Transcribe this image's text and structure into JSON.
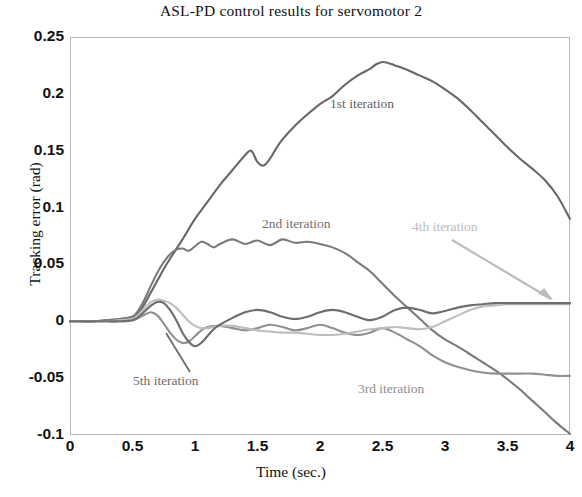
{
  "chart_data": {
    "type": "line",
    "title": "ASL-PD control results for servomotor 2",
    "xlabel": "Time (sec.)",
    "ylabel": "Tracking error (rad)",
    "xlim": [
      0,
      4
    ],
    "ylim": [
      -0.1,
      0.25
    ],
    "grid": false,
    "legend_position": "inline-annotations",
    "xticks": [
      "0",
      "0.5",
      "1",
      "1.5",
      "2",
      "2.5",
      "3",
      "3.5",
      "4"
    ],
    "xtick_values": [
      0,
      0.5,
      1,
      1.5,
      2,
      2.5,
      3,
      3.5,
      4
    ],
    "yticks": [
      "0.25",
      "0.2",
      "0.15",
      "0.1",
      "0.05",
      "0",
      "-0.05",
      "-0.1"
    ],
    "ytick_values": [
      0.25,
      0.2,
      0.15,
      0.1,
      0.05,
      0,
      -0.05,
      -0.1
    ],
    "annotations": [
      {
        "label": "1st iteration",
        "series": "1st iteration",
        "color": "#5f5f5f"
      },
      {
        "label": "2nd iteration",
        "series": "2nd iteration",
        "color": "#707070"
      },
      {
        "label": "3rd iteration",
        "series": "3rd iteration",
        "color": "#8d8d8d"
      },
      {
        "label": "4th iteration",
        "series": "4th iteration",
        "color": "#bcbcbc",
        "leader": "arrow"
      },
      {
        "label": "5th iteration",
        "series": "5th iteration",
        "color": "#6d6d6d",
        "leader": "line"
      }
    ],
    "series": [
      {
        "name": "1st iteration",
        "color": "#676767",
        "x": [
          0,
          0.1,
          0.2,
          0.3,
          0.4,
          0.5,
          0.55,
          0.6,
          0.65,
          0.7,
          0.75,
          0.8,
          0.9,
          1.0,
          1.1,
          1.2,
          1.3,
          1.4,
          1.45,
          1.5,
          1.55,
          1.6,
          1.65,
          1.7,
          1.8,
          1.9,
          2.0,
          2.1,
          2.2,
          2.3,
          2.4,
          2.45,
          2.5,
          2.55,
          2.6,
          2.7,
          2.8,
          2.9,
          3.0,
          3.1,
          3.2,
          3.3,
          3.4,
          3.5,
          3.6,
          3.7,
          3.8,
          3.9,
          4.0
        ],
        "y": [
          0.0,
          0.0,
          0.0,
          0.001,
          0.002,
          0.004,
          0.008,
          0.016,
          0.026,
          0.036,
          0.046,
          0.055,
          0.072,
          0.09,
          0.105,
          0.12,
          0.133,
          0.146,
          0.15,
          0.14,
          0.137,
          0.143,
          0.152,
          0.16,
          0.172,
          0.182,
          0.191,
          0.198,
          0.208,
          0.216,
          0.222,
          0.226,
          0.228,
          0.227,
          0.225,
          0.221,
          0.216,
          0.211,
          0.204,
          0.196,
          0.186,
          0.175,
          0.164,
          0.153,
          0.143,
          0.134,
          0.124,
          0.11,
          0.09
        ]
      },
      {
        "name": "2nd iteration",
        "color": "#7a7a7a",
        "x": [
          0,
          0.1,
          0.2,
          0.3,
          0.4,
          0.5,
          0.55,
          0.6,
          0.65,
          0.7,
          0.75,
          0.8,
          0.85,
          0.9,
          0.95,
          1.0,
          1.05,
          1.1,
          1.15,
          1.2,
          1.3,
          1.4,
          1.5,
          1.6,
          1.7,
          1.8,
          1.9,
          2.0,
          2.1,
          2.2,
          2.3,
          2.4,
          2.5,
          2.6,
          2.7,
          2.8,
          2.9,
          3.0,
          3.1,
          3.2,
          3.3,
          3.4,
          3.5,
          3.6,
          3.7,
          3.8,
          3.9,
          4.0
        ],
        "y": [
          0.0,
          0.0,
          0.0,
          0.001,
          0.002,
          0.004,
          0.01,
          0.02,
          0.032,
          0.043,
          0.052,
          0.059,
          0.063,
          0.064,
          0.062,
          0.066,
          0.07,
          0.068,
          0.065,
          0.068,
          0.072,
          0.068,
          0.071,
          0.067,
          0.072,
          0.069,
          0.07,
          0.068,
          0.065,
          0.06,
          0.052,
          0.044,
          0.033,
          0.022,
          0.012,
          0.002,
          -0.008,
          -0.016,
          -0.022,
          -0.029,
          -0.036,
          -0.043,
          -0.051,
          -0.06,
          -0.07,
          -0.08,
          -0.09,
          -0.099
        ]
      },
      {
        "name": "3rd iteration",
        "color": "#909090",
        "x": [
          0,
          0.1,
          0.2,
          0.3,
          0.4,
          0.5,
          0.55,
          0.6,
          0.65,
          0.7,
          0.75,
          0.8,
          0.85,
          0.9,
          0.95,
          1.0,
          1.05,
          1.1,
          1.2,
          1.3,
          1.4,
          1.5,
          1.6,
          1.7,
          1.8,
          1.9,
          2.0,
          2.1,
          2.2,
          2.3,
          2.4,
          2.5,
          2.6,
          2.7,
          2.8,
          2.9,
          3.0,
          3.1,
          3.2,
          3.3,
          3.4,
          3.5,
          3.6,
          3.7,
          3.8,
          3.9,
          4.0
        ],
        "y": [
          0.0,
          0.0,
          0.0,
          0.0,
          0.0,
          0.001,
          0.003,
          0.006,
          0.008,
          0.005,
          -0.002,
          -0.01,
          -0.016,
          -0.019,
          -0.018,
          -0.013,
          -0.008,
          -0.005,
          -0.004,
          -0.006,
          -0.008,
          -0.006,
          -0.003,
          -0.005,
          -0.008,
          -0.006,
          -0.003,
          -0.006,
          -0.01,
          -0.012,
          -0.01,
          -0.006,
          -0.01,
          -0.016,
          -0.022,
          -0.03,
          -0.036,
          -0.04,
          -0.043,
          -0.045,
          -0.046,
          -0.046,
          -0.046,
          -0.046,
          -0.047,
          -0.048,
          -0.048
        ]
      },
      {
        "name": "4th iteration",
        "color": "#bdbdbd",
        "x": [
          0,
          0.1,
          0.2,
          0.3,
          0.4,
          0.5,
          0.55,
          0.6,
          0.65,
          0.7,
          0.75,
          0.8,
          0.85,
          0.9,
          0.95,
          1.0,
          1.05,
          1.1,
          1.2,
          1.3,
          1.4,
          1.5,
          1.6,
          1.7,
          1.8,
          1.9,
          2.0,
          2.1,
          2.2,
          2.3,
          2.4,
          2.5,
          2.6,
          2.7,
          2.8,
          2.9,
          3.0,
          3.1,
          3.2,
          3.3,
          3.4,
          3.5,
          3.6,
          3.7,
          3.8,
          3.9,
          4.0
        ],
        "y": [
          0.0,
          0.0,
          0.0,
          0.0,
          0.001,
          0.002,
          0.006,
          0.012,
          0.017,
          0.019,
          0.018,
          0.016,
          0.012,
          0.006,
          0.0,
          -0.004,
          -0.006,
          -0.006,
          -0.004,
          -0.004,
          -0.006,
          -0.008,
          -0.009,
          -0.01,
          -0.01,
          -0.011,
          -0.012,
          -0.012,
          -0.011,
          -0.009,
          -0.007,
          -0.006,
          -0.005,
          -0.006,
          -0.007,
          -0.005,
          0.0,
          0.005,
          0.01,
          0.013,
          0.014,
          0.015,
          0.015,
          0.015,
          0.015,
          0.015,
          0.015
        ]
      },
      {
        "name": "5th iteration",
        "color": "#6d6d6d",
        "x": [
          0,
          0.1,
          0.2,
          0.3,
          0.4,
          0.5,
          0.55,
          0.6,
          0.65,
          0.7,
          0.75,
          0.8,
          0.85,
          0.9,
          0.95,
          1.0,
          1.05,
          1.1,
          1.15,
          1.2,
          1.3,
          1.4,
          1.5,
          1.6,
          1.7,
          1.8,
          1.9,
          2.0,
          2.1,
          2.2,
          2.3,
          2.4,
          2.5,
          2.6,
          2.7,
          2.8,
          2.9,
          3.0,
          3.1,
          3.2,
          3.3,
          3.4,
          3.5,
          3.6,
          3.7,
          3.8,
          3.9,
          4.0
        ],
        "y": [
          0.0,
          0.0,
          0.0,
          0.0,
          0.0,
          0.001,
          0.004,
          0.009,
          0.014,
          0.017,
          0.016,
          0.01,
          0.001,
          -0.01,
          -0.018,
          -0.022,
          -0.019,
          -0.013,
          -0.007,
          -0.003,
          0.003,
          0.008,
          0.01,
          0.008,
          0.004,
          0.002,
          0.004,
          0.008,
          0.01,
          0.008,
          0.004,
          0.001,
          0.004,
          0.01,
          0.012,
          0.01,
          0.007,
          0.009,
          0.012,
          0.014,
          0.015,
          0.016,
          0.016,
          0.016,
          0.016,
          0.016,
          0.016,
          0.016
        ]
      }
    ]
  }
}
